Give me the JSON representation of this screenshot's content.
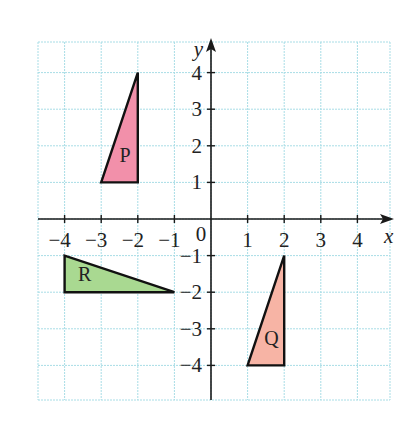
{
  "diagram": {
    "type": "coordinate-grid",
    "axes": {
      "x_label": "x",
      "y_label": "y",
      "origin_label": "0",
      "x_ticks": [
        -4,
        -3,
        -2,
        -1,
        1,
        2,
        3,
        4
      ],
      "y_ticks": [
        4,
        3,
        2,
        1,
        -1,
        -2,
        -3,
        -4
      ],
      "x_tick_labels": [
        "−4",
        "−3",
        "−2",
        "−1",
        "1",
        "2",
        "3",
        "4"
      ],
      "y_tick_labels": [
        "4",
        "3",
        "2",
        "1",
        "−1",
        "−2",
        "−3",
        "−4"
      ],
      "x_range": [
        -5,
        5
      ],
      "y_range": [
        -5,
        5
      ]
    },
    "grid": {
      "color": "#a8dde6",
      "spacing": 1,
      "x_min": -5,
      "x_max": 5,
      "y_min": -5,
      "y_max": 5
    },
    "shapes": [
      {
        "label": "P",
        "vertices": [
          [
            -3,
            1
          ],
          [
            -2,
            1
          ],
          [
            -2,
            4
          ]
        ],
        "fill": "#f290aa",
        "label_pos": [
          -2.35,
          1.55
        ]
      },
      {
        "label": "Q",
        "vertices": [
          [
            1,
            -4
          ],
          [
            2,
            -4
          ],
          [
            2,
            -1
          ]
        ],
        "fill": "#f7b4a5",
        "label_pos": [
          1.65,
          -3.45
        ]
      },
      {
        "label": "R",
        "vertices": [
          [
            -4,
            -1
          ],
          [
            -4,
            -2
          ],
          [
            -1,
            -2
          ]
        ],
        "fill": "#a9d991",
        "label_pos": [
          -3.45,
          -1.7
        ]
      }
    ]
  }
}
